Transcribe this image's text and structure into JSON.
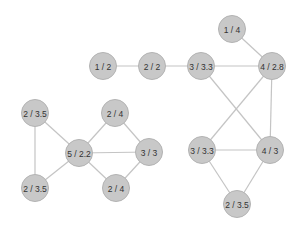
{
  "diagram": {
    "type": "graph",
    "node_color": "#c8c8c8",
    "edge_color": "#c4c4c4",
    "nodes": [
      {
        "id": "a1",
        "label": "1 / 2",
        "x": 103,
        "y": 66
      },
      {
        "id": "a2",
        "label": "2 / 2",
        "x": 152,
        "y": 66
      },
      {
        "id": "a3",
        "label": "3 / 3.3",
        "x": 201,
        "y": 66
      },
      {
        "id": "a4",
        "label": "4 / 2.8",
        "x": 272,
        "y": 66
      },
      {
        "id": "a5",
        "label": "1 / 4",
        "x": 232,
        "y": 29
      },
      {
        "id": "b1",
        "label": "3 / 3.3",
        "x": 202,
        "y": 150
      },
      {
        "id": "b2",
        "label": "4 / 3",
        "x": 270,
        "y": 150
      },
      {
        "id": "b3",
        "label": "2 / 3.5",
        "x": 237,
        "y": 204
      },
      {
        "id": "c1",
        "label": "2 / 3.5",
        "x": 35,
        "y": 113
      },
      {
        "id": "c2",
        "label": "5 / 2.2",
        "x": 79,
        "y": 153
      },
      {
        "id": "c3",
        "label": "2 / 4",
        "x": 115,
        "y": 113
      },
      {
        "id": "c4",
        "label": "3 / 3",
        "x": 149,
        "y": 152
      },
      {
        "id": "c5",
        "label": "2 / 4",
        "x": 116,
        "y": 188
      },
      {
        "id": "c6",
        "label": "2 / 3.5",
        "x": 35,
        "y": 188
      }
    ],
    "edges": [
      [
        "a1",
        "a2"
      ],
      [
        "a2",
        "a3"
      ],
      [
        "a3",
        "a4"
      ],
      [
        "a5",
        "a4"
      ],
      [
        "a3",
        "b2"
      ],
      [
        "a4",
        "b1"
      ],
      [
        "a4",
        "b2"
      ],
      [
        "b1",
        "b2"
      ],
      [
        "b1",
        "b3"
      ],
      [
        "b2",
        "b3"
      ],
      [
        "c1",
        "c2"
      ],
      [
        "c1",
        "c6"
      ],
      [
        "c2",
        "c6"
      ],
      [
        "c2",
        "c3"
      ],
      [
        "c2",
        "c4"
      ],
      [
        "c2",
        "c5"
      ],
      [
        "c3",
        "c4"
      ],
      [
        "c4",
        "c5"
      ]
    ]
  }
}
